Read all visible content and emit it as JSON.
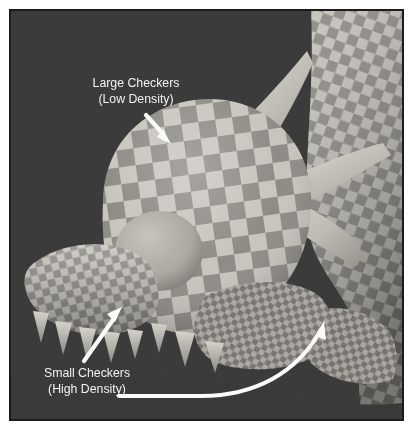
{
  "figure": {
    "kind": "3d-render-screenshot",
    "background_color": "#3b3b3b",
    "border_color": "#1c1c1c",
    "page_color": "#ffffff",
    "checker_light_color": "#c9c6c0",
    "checker_dark_color": "#8a8782",
    "annotation_color": "#f7f7f7"
  },
  "annotations": [
    {
      "id": "large-checkers",
      "line1": "Large Checkers",
      "line2": "(Low Density)",
      "arrow": "straight-down-right",
      "text_x": 126,
      "text_y": 82
    },
    {
      "id": "small-checkers",
      "line1": "Small Checkers",
      "line2": "(High Density)",
      "arrow": "straight-up-right-and-curved-right",
      "text_x": 77,
      "text_y": 374
    }
  ],
  "model": {
    "parts": [
      "head",
      "snout",
      "teeth",
      "eye",
      "upper-horn",
      "lower-horn",
      "brow-spike",
      "neck",
      "jaw",
      "body"
    ],
    "eye_color": "#b9b5ae"
  }
}
